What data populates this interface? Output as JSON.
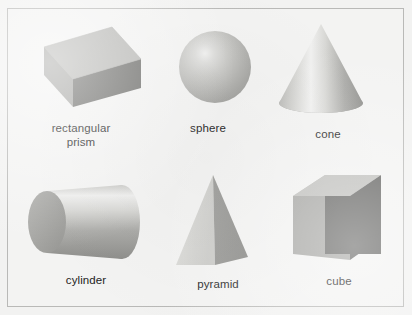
{
  "figure": {
    "background_color": "#f2f2f1",
    "frame_border_color": "#b9b9b7",
    "label_color": "#1d1d1d",
    "rows": 2,
    "columns": 3
  },
  "shapes": [
    {
      "id": "rectangular-prism",
      "label": "rectangular\nprism",
      "icon": "rectangular-prism-icon",
      "row": 1,
      "column": 1,
      "colors": {
        "top": "#b6b6b3",
        "side": "#a8a8a5",
        "front": "#6e6e6b"
      }
    },
    {
      "id": "sphere",
      "label": "sphere",
      "icon": "sphere-icon",
      "row": 1,
      "column": 2,
      "colors": {
        "highlight": "#efefee",
        "mid": "#c2c2bf",
        "shade": "#9b9b98"
      }
    },
    {
      "id": "cone",
      "label": "cone",
      "icon": "cone-icon",
      "row": 1,
      "column": 3,
      "colors": {
        "highlight": "#f0f0ef",
        "mid": "#c0c0bd",
        "shade": "#8f8f8c"
      }
    },
    {
      "id": "cylinder",
      "label": "cylinder",
      "icon": "cylinder-icon",
      "row": 2,
      "column": 1,
      "colors": {
        "cap": "#a6a6a3",
        "highlight": "#eeeeed",
        "shade": "#949491"
      }
    },
    {
      "id": "pyramid",
      "label": "pyramid",
      "icon": "pyramid-icon",
      "row": 2,
      "column": 2,
      "colors": {
        "left_face": "#d5d5d2",
        "right_face": "#8e8e8b"
      }
    },
    {
      "id": "cube",
      "label": "cube",
      "icon": "cube-icon",
      "row": 2,
      "column": 3,
      "colors": {
        "top": "#bdbdba",
        "side": "#a4a4a1",
        "front": "#5f5f5d"
      }
    }
  ]
}
